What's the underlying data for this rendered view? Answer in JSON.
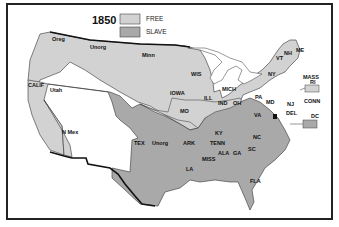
{
  "map": {
    "year": "1850",
    "colors": {
      "free": "#d2d2d2",
      "slave": "#a9a9a9",
      "border": "#222222",
      "water": "#ffffff"
    },
    "legend": [
      {
        "key": "free",
        "label": "FREE"
      },
      {
        "key": "slave",
        "label": "SLAVE"
      }
    ],
    "regions": {
      "oreg": "Oreg",
      "unorg_n": "Unorg",
      "minn": "Minn",
      "calif": "CALIF",
      "utah": "Utah",
      "n_mex": "N Mex",
      "tex": "TEX",
      "unorg_s": "Unorg",
      "wis": "WIS",
      "iowa": "IOWA",
      "ill": "ILL",
      "mich": "MICH",
      "ind": "IND",
      "oh": "OH",
      "mo": "MO",
      "ky": "KY",
      "tenn": "TENN",
      "ark": "ARK",
      "la": "LA",
      "miss": "MISS",
      "ala": "ALA",
      "ga": "GA",
      "sc": "SC",
      "nc": "NC",
      "fla": "FLA",
      "va": "VA",
      "md": "MD",
      "del": "DEL",
      "pa": "PA",
      "nj": "NJ",
      "ny": "NY",
      "vt": "VT",
      "nh": "NH",
      "me": "ME",
      "mass": "MASS",
      "ri": "RI",
      "conn": "CONN",
      "dc": "DC"
    }
  }
}
